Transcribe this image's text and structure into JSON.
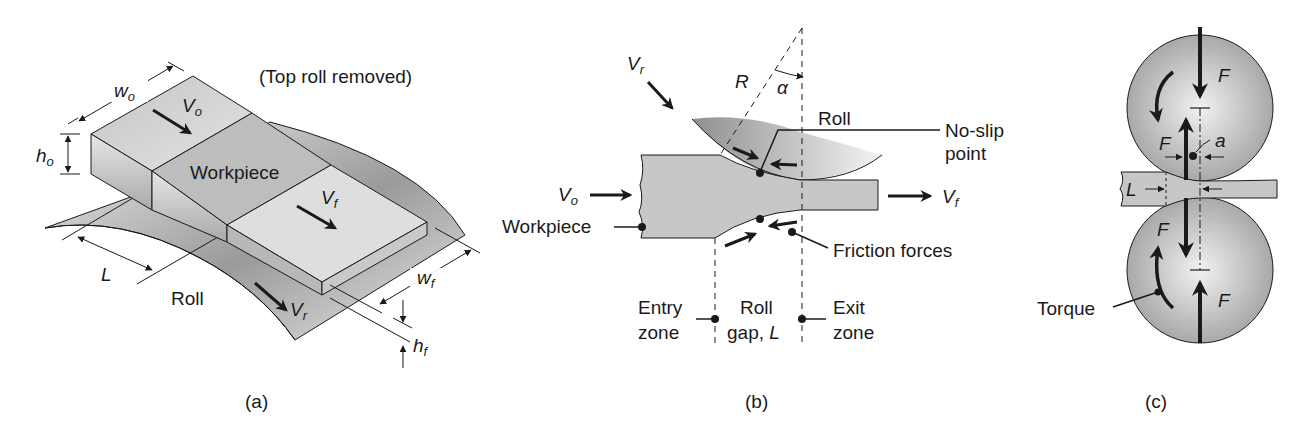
{
  "figure": {
    "panels": [
      {
        "id": "a",
        "caption": "(a)",
        "note": "(Top roll removed)",
        "labels": {
          "workpiece": "Workpiece",
          "roll": "Roll",
          "w_o": "w",
          "w_o_sub": "o",
          "h_o": "h",
          "h_o_sub": "o",
          "V_o": "V",
          "V_o_sub": "o",
          "V_f": "V",
          "V_f_sub": "f",
          "V_r": "V",
          "V_r_sub": "r",
          "L": "L",
          "w_f": "w",
          "w_f_sub": "f",
          "h_f": "h",
          "h_f_sub": "f"
        }
      },
      {
        "id": "b",
        "caption": "(b)",
        "labels": {
          "V_r": "V",
          "V_r_sub": "r",
          "R": "R",
          "alpha": "α",
          "roll": "Roll",
          "no_slip_1": "No-slip",
          "no_slip_2": "point",
          "V_o": "V",
          "V_o_sub": "o",
          "V_f": "V",
          "V_f_sub": "f",
          "workpiece": "Workpiece",
          "friction": "Friction forces",
          "entry_1": "Entry",
          "entry_2": "zone",
          "gap_1": "Roll",
          "gap_2": "gap,",
          "gap_L": "L",
          "exit_1": "Exit",
          "exit_2": "zone"
        }
      },
      {
        "id": "c",
        "caption": "(c)",
        "labels": {
          "F_top": "F",
          "F_mid_upper": "F",
          "a": "a",
          "L": "L",
          "F_mid_lower": "F",
          "F_bottom": "F",
          "torque": "Torque"
        }
      }
    ],
    "colors": {
      "ink": "#1a1a1a",
      "roll_dark": "#8f8f8f",
      "roll_light": "#f0f0f0",
      "workpiece": "#c8c8c8",
      "background": "#ffffff"
    }
  }
}
